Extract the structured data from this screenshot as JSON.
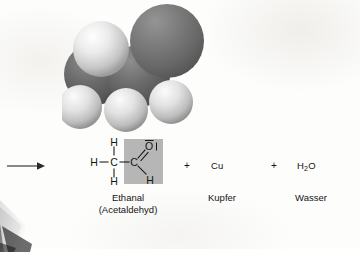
{
  "figure": {
    "type": "chemistry-reaction-diagram",
    "language": "de",
    "background_color": "#fdfdfc",
    "text_color": "#141414"
  },
  "molecule": {
    "name": "space-filling-model-ethanal",
    "description": "Kalottenmodell von Ethanal (Acetaldehyd)",
    "atoms": [
      {
        "element": "O",
        "label": "oxygen-sphere",
        "color": "#6e6e6e",
        "cx": 104,
        "cy": 38,
        "r": 36
      },
      {
        "element": "C",
        "label": "carbon-sphere-carbonyl",
        "color": "#5e5e5e",
        "cx": 76,
        "cy": 72,
        "r": 31
      },
      {
        "element": "C",
        "label": "carbon-sphere-methyl",
        "color": "#5e5e5e",
        "cx": 32,
        "cy": 70,
        "r": 31
      },
      {
        "element": "H",
        "label": "hydrogen-sphere-top",
        "color": "#e9e9e9",
        "cx": 38,
        "cy": 46,
        "r": 27
      },
      {
        "element": "H",
        "label": "hydrogen-sphere-lower-left",
        "color": "#e3e3e3",
        "cx": 16,
        "cy": 104,
        "r": 21
      },
      {
        "element": "H",
        "label": "hydrogen-sphere-lower-mid",
        "color": "#e3e3e3",
        "cx": 62,
        "cy": 108,
        "r": 21
      },
      {
        "element": "H",
        "label": "hydrogen-sphere-lower-right",
        "color": "#e3e3e3",
        "cx": 108,
        "cy": 100,
        "r": 21
      }
    ]
  },
  "reaction": {
    "arrow": "→",
    "highlight_color": "#b6b6b6",
    "terms": [
      {
        "id": "product-1",
        "formula_kind": "structural",
        "caption": "Ethanal",
        "caption_sub": "(Acetaldehyd)"
      },
      {
        "id": "plus-1",
        "symbol": "+"
      },
      {
        "id": "product-2",
        "symbol": "Cu",
        "caption": "Kupfer"
      },
      {
        "id": "plus-2",
        "symbol": "+"
      },
      {
        "id": "product-3",
        "symbol_main": "H",
        "symbol_sub": "2",
        "symbol_tail": "O",
        "caption": "Wasser"
      }
    ],
    "structural_formula": {
      "atoms": {
        "h_left": "H",
        "c1": "C",
        "h_c1_top": "H",
        "h_c1_bottom": "H",
        "c2": "C",
        "o": "O",
        "o_lone_pair": "l",
        "h_c2_bottom": "H"
      },
      "bonds": [
        {
          "from": "h_left",
          "to": "c1",
          "order": 1
        },
        {
          "from": "h_c1_top",
          "to": "c1",
          "order": 1
        },
        {
          "from": "h_c1_bottom",
          "to": "c1",
          "order": 1
        },
        {
          "from": "c1",
          "to": "c2",
          "order": 1
        },
        {
          "from": "c2",
          "to": "o",
          "order": 2
        },
        {
          "from": "c2",
          "to": "h_c2_bottom",
          "order": 1
        }
      ]
    }
  }
}
